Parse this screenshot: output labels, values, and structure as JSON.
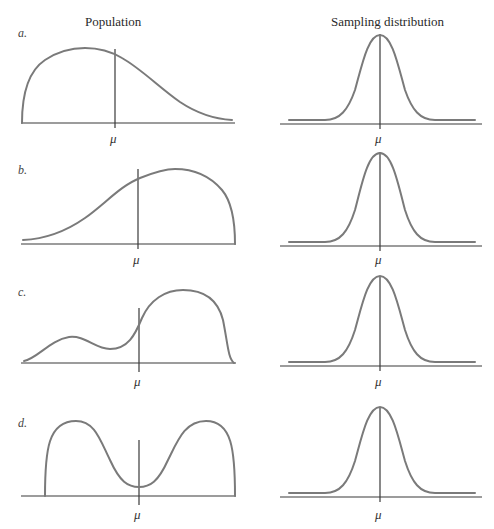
{
  "columns": {
    "left_title": "Population",
    "right_title": "Sampling distribution"
  },
  "panels": [
    {
      "label": "a.",
      "mean_symbol": "μ",
      "population_shape": "right-skewed",
      "sampling_shape": "normal"
    },
    {
      "label": "b.",
      "mean_symbol": "μ",
      "population_shape": "left-skewed",
      "sampling_shape": "normal"
    },
    {
      "label": "c.",
      "mean_symbol": "μ",
      "population_shape": "bimodal-asymmetric",
      "sampling_shape": "normal"
    },
    {
      "label": "d.",
      "mean_symbol": "μ",
      "population_shape": "symmetric-bimodal",
      "sampling_shape": "normal"
    }
  ],
  "colors": {
    "curve": "#7a7a7a",
    "axis": "#3a3a3a",
    "background": "#ffffff"
  }
}
